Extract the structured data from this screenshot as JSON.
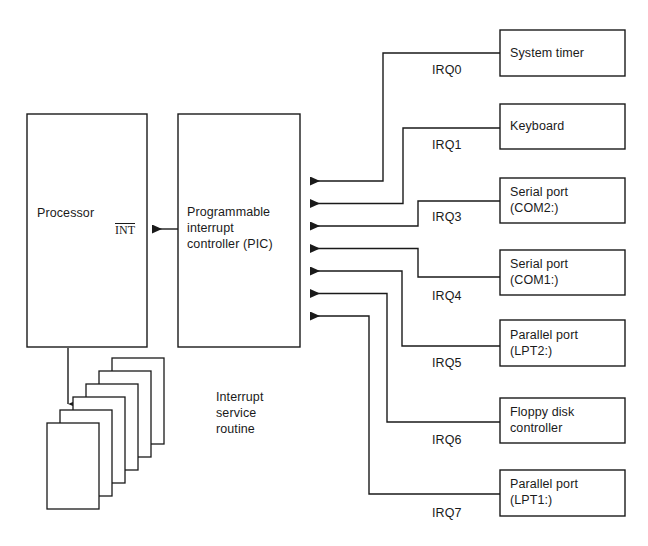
{
  "diagram": {
    "colors": {
      "line": "#1a1a1a",
      "text": "#1a1a1a",
      "background": "#ffffff"
    }
  },
  "processor": {
    "label": "Processor",
    "int_signal": "INT"
  },
  "pic": {
    "label": "Programmable\ninterrupt\ncontroller (PIC)"
  },
  "isr": {
    "label": "Interrupt\nservice\nroutine",
    "card_count": 6
  },
  "irq_lines": [
    {
      "irq": "IRQ0",
      "device": "System timer"
    },
    {
      "irq": "IRQ1",
      "device": "Keyboard"
    },
    {
      "irq": "IRQ3",
      "device": "Serial port\n(COM2:)"
    },
    {
      "irq": "IRQ4",
      "device": "Serial port\n(COM1:)"
    },
    {
      "irq": "IRQ5",
      "device": "Parallel port\n(LPT2:)"
    },
    {
      "irq": "IRQ6",
      "device": "Floppy disk\ncontroller"
    },
    {
      "irq": "IRQ7",
      "device": "Parallel port\n(LPT1:)"
    }
  ]
}
